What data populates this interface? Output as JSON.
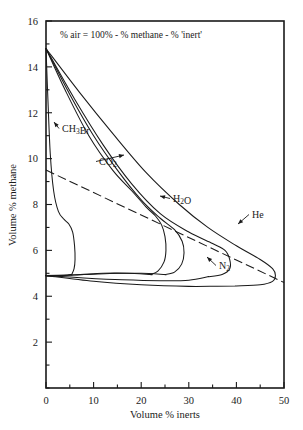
{
  "chart_data": {
    "type": "line",
    "title": "",
    "note": "% air = 100% - % methane - % 'inert'",
    "xlabel": "Volume % inerts",
    "ylabel": "Volume % methane",
    "xlim": [
      0,
      50
    ],
    "ylim": [
      0,
      16
    ],
    "xticks": [
      0,
      10,
      20,
      30,
      40,
      50
    ],
    "yticks": [
      2,
      4,
      6,
      8,
      10,
      12,
      14,
      16
    ],
    "xtick_labels": [
      "0",
      "10",
      "20",
      "30",
      "40",
      "50"
    ],
    "ytick_labels": [
      "2",
      "4",
      "6",
      "8",
      "10",
      "12",
      "14",
      "16"
    ],
    "xminor_step": 5,
    "yminor_step": 1,
    "grid": false,
    "legend": "inline-annotations",
    "upper_flammability_limit_at_zero_inert": 14.8,
    "lower_flammability_limit_at_zero_inert": 4.9,
    "series": [
      {
        "name": "CH3Br",
        "label": "CH₃Br",
        "label_x": 62,
        "label_y": 132,
        "nose_x": 5.2,
        "nose_y": 7.2,
        "points_upper": [
          [
            0,
            14.8
          ],
          [
            0.4,
            12.6
          ],
          [
            0.9,
            10.2
          ],
          [
            1.6,
            8.6
          ],
          [
            2.6,
            7.7
          ],
          [
            3.8,
            7.35
          ],
          [
            4.8,
            7.15
          ],
          [
            5.6,
            6.8
          ],
          [
            6.0,
            6.2
          ],
          [
            6.1,
            5.6
          ],
          [
            5.9,
            5.2
          ],
          [
            5.4,
            4.95
          ]
        ],
        "points_lower": [
          [
            0,
            4.9
          ],
          [
            1.5,
            4.9
          ],
          [
            3.0,
            4.9
          ],
          [
            4.5,
            4.92
          ],
          [
            5.4,
            4.95
          ]
        ]
      },
      {
        "name": "CO2",
        "label": "CO₂",
        "label_x": 99,
        "label_y": 165,
        "nose_x": 24.0,
        "nose_y": 7.4,
        "points_upper": [
          [
            0,
            14.8
          ],
          [
            4,
            13.0
          ],
          [
            9,
            11.0
          ],
          [
            14,
            9.5
          ],
          [
            18,
            8.6
          ],
          [
            21,
            7.9
          ],
          [
            23,
            7.5
          ],
          [
            24.3,
            7.1
          ],
          [
            25,
            6.6
          ],
          [
            25.2,
            6.0
          ],
          [
            24.8,
            5.5
          ],
          [
            23.5,
            5.1
          ],
          [
            22,
            4.95
          ]
        ],
        "points_lower": [
          [
            0,
            4.9
          ],
          [
            6,
            4.93
          ],
          [
            12,
            5.0
          ],
          [
            17,
            5.0
          ],
          [
            22,
            4.95
          ]
        ]
      },
      {
        "name": "H2O",
        "label": "H₂O",
        "label_x": 173,
        "label_y": 202,
        "nose_x": 27.5,
        "nose_y": 7.0,
        "points_upper": [
          [
            0,
            14.8
          ],
          [
            5,
            12.8
          ],
          [
            10,
            11.0
          ],
          [
            15,
            9.5
          ],
          [
            20,
            8.2
          ],
          [
            24,
            7.4
          ],
          [
            27,
            6.9
          ],
          [
            28.6,
            6.4
          ],
          [
            29,
            5.9
          ],
          [
            28.5,
            5.4
          ],
          [
            27,
            5.05
          ],
          [
            25,
            4.95
          ]
        ],
        "points_lower": [
          [
            0,
            4.9
          ],
          [
            8,
            4.95
          ],
          [
            15,
            5.0
          ],
          [
            20,
            5.0
          ],
          [
            25,
            4.95
          ]
        ]
      },
      {
        "name": "N2",
        "label": "N₂",
        "label_x": 219,
        "label_y": 269,
        "nose_x": 37.0,
        "nose_y": 6.2,
        "points_upper": [
          [
            0,
            14.8
          ],
          [
            6,
            12.6
          ],
          [
            12,
            10.6
          ],
          [
            18,
            8.9
          ],
          [
            24,
            7.6
          ],
          [
            30,
            6.8
          ],
          [
            35,
            6.3
          ],
          [
            37.6,
            6.0
          ],
          [
            38.6,
            5.6
          ],
          [
            38.6,
            5.2
          ],
          [
            37,
            4.95
          ],
          [
            34,
            4.85
          ]
        ],
        "points_lower": [
          [
            0,
            4.9
          ],
          [
            8,
            4.8
          ],
          [
            16,
            4.72
          ],
          [
            24,
            4.68
          ],
          [
            30,
            4.7
          ],
          [
            34,
            4.85
          ]
        ]
      },
      {
        "name": "He",
        "label": "He",
        "label_x": 252,
        "label_y": 218,
        "nose_x": 47.5,
        "nose_y": 5.6,
        "points_upper": [
          [
            0,
            14.8
          ],
          [
            7,
            12.9
          ],
          [
            14,
            11.1
          ],
          [
            21,
            9.4
          ],
          [
            28,
            8.0
          ],
          [
            34,
            7.0
          ],
          [
            40,
            6.2
          ],
          [
            45,
            5.6
          ],
          [
            47.6,
            5.2
          ],
          [
            48.2,
            4.9
          ],
          [
            47.6,
            4.65
          ],
          [
            45,
            4.5
          ],
          [
            40,
            4.45
          ]
        ],
        "points_lower": [
          [
            0,
            4.9
          ],
          [
            10,
            4.65
          ],
          [
            20,
            4.5
          ],
          [
            30,
            4.43
          ],
          [
            36,
            4.44
          ],
          [
            40,
            4.45
          ]
        ]
      }
    ],
    "air_line": {
      "name": "air-dilution-line",
      "style": "dashed",
      "from": [
        0,
        9.5
      ],
      "to": [
        50,
        4.6
      ]
    }
  },
  "axes": {
    "x_title": "Volume % inerts",
    "y_title": "Volume % methane"
  }
}
